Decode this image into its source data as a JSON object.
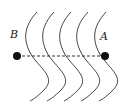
{
  "diagram": {
    "type": "wavefronts",
    "wavefront_count": 5,
    "points": [
      {
        "label": "B",
        "x": 17,
        "y": 56
      },
      {
        "label": "A",
        "x": 105,
        "y": 56
      }
    ],
    "connector": "dashed-line",
    "colors": {
      "line": "#333333",
      "dot": "#111111"
    }
  }
}
